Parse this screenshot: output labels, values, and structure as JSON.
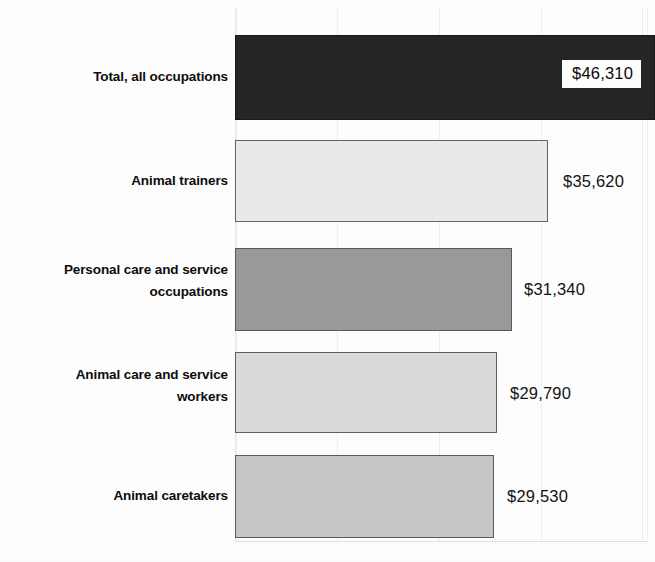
{
  "chart_data": {
    "type": "bar",
    "orientation": "horizontal",
    "title": "",
    "xlabel": "",
    "ylabel": "",
    "grid": "vertical-faint",
    "legend": "none",
    "xlim": [
      0,
      50000
    ],
    "categories": [
      "Total, all occupations",
      "Animal trainers",
      "Personal care and service occupations",
      "Animal care and service workers",
      "Animal caretakers"
    ],
    "values": [
      46310,
      35620,
      31340,
      29790,
      29530
    ],
    "value_labels": [
      "$46,310",
      "$35,620",
      "$31,340",
      "$29,790",
      "$29,530"
    ],
    "bars": [
      {
        "category_line1": "Total, all occupations",
        "category_line2": "",
        "value": 46310,
        "value_label": "$46,310",
        "color": "#262626",
        "border_color": "#1a1a1a",
        "label_position": "inside",
        "left": 235,
        "top": 35,
        "width": 420,
        "height": 85,
        "label_left": 562,
        "label_top": 60
      },
      {
        "category_line1": "Animal trainers",
        "category_line2": "",
        "value": 35620,
        "value_label": "$35,620",
        "color": "#ebebeb",
        "border_color": "#646464",
        "label_position": "outside",
        "left": 235,
        "top": 140,
        "width": 313,
        "height": 82,
        "label_left": 563,
        "label_top": 172
      },
      {
        "category_line1": "Personal care and service",
        "category_line2": "occupations",
        "value": 31340,
        "value_label": "$31,340",
        "color": "#9a9a9a",
        "border_color": "#5a5a5a",
        "label_position": "outside",
        "left": 235,
        "top": 248,
        "width": 277,
        "height": 83,
        "label_left": 524,
        "label_top": 280
      },
      {
        "category_line1": "Animal care and service",
        "category_line2": "workers",
        "value": 29790,
        "value_label": "$29,790",
        "color": "#dcdcdc",
        "border_color": "#606060",
        "label_position": "outside",
        "left": 235,
        "top": 352,
        "width": 262,
        "height": 81,
        "label_left": 510,
        "label_top": 384
      },
      {
        "category_line1": "Animal caretakers",
        "category_line2": "",
        "value": 29530,
        "value_label": "$29,530",
        "color": "#c8c8c8",
        "border_color": "#5c5c5c",
        "label_position": "outside",
        "left": 235,
        "top": 455,
        "width": 259,
        "height": 83,
        "label_left": 507,
        "label_top": 487
      }
    ],
    "category_label_positions": [
      {
        "top": 66
      },
      {
        "top": 170
      },
      {
        "top": 259
      },
      {
        "top": 364
      },
      {
        "top": 485
      }
    ],
    "gridlines_x": [
      235,
      336,
      438,
      540,
      641
    ]
  }
}
